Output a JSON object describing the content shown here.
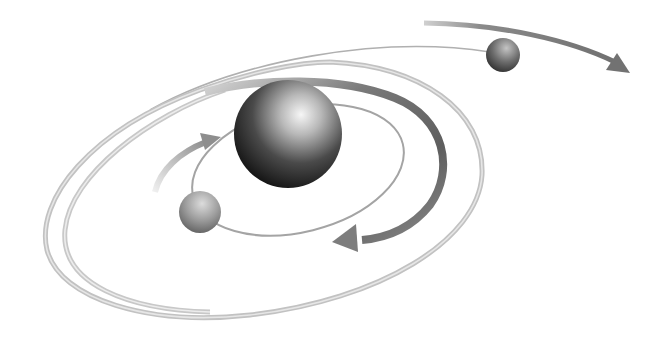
{
  "diagram": {
    "background": "#ffffff",
    "central_body": {
      "label": "",
      "cx": 288,
      "cy": 134,
      "r": 54,
      "shade_dark": "#141414",
      "shade_light": "#f4f4f4"
    },
    "satellites": [
      {
        "name": "inner-satellite",
        "cx": 200,
        "cy": 212,
        "r": 21,
        "shade_dark": "#5a5a5a",
        "shade_light": "#d8d8d8"
      },
      {
        "name": "outer-satellite",
        "cx": 503,
        "cy": 55,
        "r": 17,
        "shade_dark": "#2e2e2e",
        "shade_light": "#bcbcbc"
      }
    ],
    "orbits": [
      {
        "name": "inner-orbit",
        "style": "thin line",
        "color": "#9a9a9a"
      },
      {
        "name": "middle-ribbon",
        "style": "dark ribbon",
        "color": "#6c6c6c"
      },
      {
        "name": "outer-ring-1",
        "style": "light tube",
        "color": "#c4c4c4"
      },
      {
        "name": "outer-ring-2",
        "style": "light tube",
        "color": "#cdcdcd"
      },
      {
        "name": "far-orbit",
        "style": "thin line",
        "color": "#a8a8a8"
      }
    ],
    "arrows": [
      {
        "name": "inner-clockwise-arrow",
        "direction": "clockwise",
        "color": "#9a9a9a"
      },
      {
        "name": "middle-counterclockwise-arrow",
        "direction": "down-left",
        "color": "#7d7d7d"
      },
      {
        "name": "far-right-arrow",
        "direction": "right",
        "color": "#7a7a7a"
      }
    ],
    "colors": {
      "ring_light": "#d0d0d0",
      "ring_mid": "#a6a6a6",
      "ribbon_dark": "#666666",
      "arrow_gray": "#808080"
    }
  }
}
